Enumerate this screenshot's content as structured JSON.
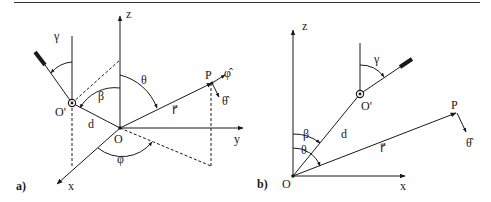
{
  "figure": {
    "panel_a": {
      "tag": "a)",
      "axes": {
        "z": "z",
        "y": "y",
        "x": "x"
      },
      "points": {
        "origin": "O",
        "origin_prime": "O'",
        "point": "P"
      },
      "lengths": {
        "d": "d",
        "r": "r⃗"
      },
      "angles": {
        "gamma": "γ",
        "beta": "β",
        "theta": "θ",
        "phi": "φ"
      },
      "unit_vectors": {
        "phi_hat": "φ̂",
        "theta_hat": "θ̂"
      }
    },
    "panel_b": {
      "tag": "b)",
      "axes": {
        "z": "z",
        "x": "x"
      },
      "points": {
        "origin": "O",
        "origin_prime": "O'",
        "point": "P"
      },
      "lengths": {
        "d": "d",
        "r": "r⃗"
      },
      "angles": {
        "gamma": "γ",
        "beta": "β",
        "theta": "θ"
      },
      "unit_vectors": {
        "theta_hat": "θ̂"
      }
    }
  }
}
